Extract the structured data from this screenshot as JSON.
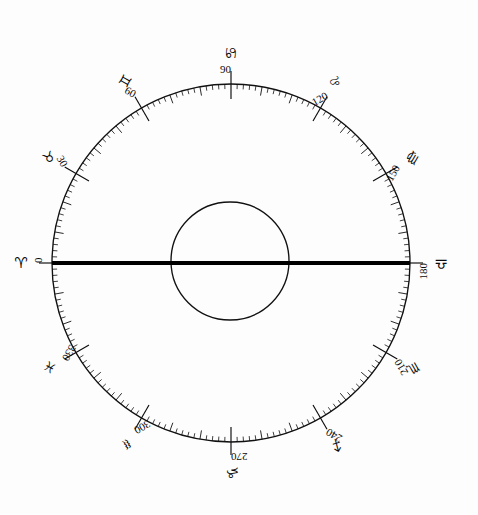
{
  "figure": {
    "background_color": "#fdfdfd",
    "ink_color": "#111111"
  },
  "geometry": {
    "center_x": 231,
    "center_y": 263,
    "outer_radius": 179,
    "inner_radius": 59,
    "tick_minor_length": 5,
    "tick_medium_length": 9,
    "tick_major_length": 15,
    "tick_minor_step_deg": 2,
    "tick_medium_step_deg": 10,
    "tick_major_step_deg": 30,
    "angle_zero_at": "left",
    "angle_direction": "clockwise-downward"
  },
  "axis": {
    "name": "horizontal-axis",
    "from_degree": 0,
    "to_degree": 180,
    "stroke_width": 4.2,
    "color": "#000000"
  },
  "chart_data": {
    "type": "scatter",
    "subtitle": "",
    "xlabel": "",
    "ylabel": "",
    "grid": false,
    "legend_position": "none",
    "axis_range_deg": [
      0,
      360
    ],
    "tick_interval_deg": 2,
    "labelled_tick_interval_deg": 30,
    "categories": [
      "Aries",
      "Taurus",
      "Gemini",
      "Cancer",
      "Leo",
      "Virgo",
      "Libra",
      "Scorpio",
      "Sagittarius",
      "Capricorn",
      "Aquarius",
      "Pisces"
    ],
    "values": [
      0,
      30,
      60,
      90,
      120,
      150,
      180,
      210,
      240,
      270,
      300,
      330
    ],
    "signs": [
      {
        "name": "Aries",
        "glyph": "♈",
        "degree": 0,
        "degree_label": "0",
        "glyph_name": "aries-glyph"
      },
      {
        "name": "Taurus",
        "glyph": "♉",
        "degree": 30,
        "degree_label": "30",
        "glyph_name": "taurus-glyph"
      },
      {
        "name": "Gemini",
        "glyph": "♊",
        "degree": 60,
        "degree_label": "60",
        "glyph_name": "gemini-glyph"
      },
      {
        "name": "Cancer",
        "glyph": "♋",
        "degree": 90,
        "degree_label": "90",
        "glyph_name": "cancer-glyph"
      },
      {
        "name": "Leo",
        "glyph": "♌",
        "degree": 120,
        "degree_label": "120",
        "glyph_name": "leo-glyph"
      },
      {
        "name": "Virgo",
        "glyph": "♍",
        "degree": 150,
        "degree_label": "150",
        "glyph_name": "virgo-glyph"
      },
      {
        "name": "Libra",
        "glyph": "♎",
        "degree": 180,
        "degree_label": "180",
        "glyph_name": "libra-glyph"
      },
      {
        "name": "Scorpio",
        "glyph": "♏",
        "degree": 210,
        "degree_label": "210",
        "glyph_name": "scorpio-glyph"
      },
      {
        "name": "Sagittarius",
        "glyph": "♐",
        "degree": 240,
        "degree_label": "240",
        "glyph_name": "sagittarius-glyph"
      },
      {
        "name": "Capricorn",
        "glyph": "♑",
        "degree": 270,
        "degree_label": "270",
        "glyph_name": "capricorn-glyph"
      },
      {
        "name": "Aquarius",
        "glyph": "♒",
        "degree": 300,
        "degree_label": "300",
        "glyph_name": "aquarius-glyph"
      },
      {
        "name": "Pisces",
        "glyph": "♓",
        "degree": 330,
        "degree_label": "330",
        "glyph_name": "pisces-glyph"
      }
    ]
  }
}
